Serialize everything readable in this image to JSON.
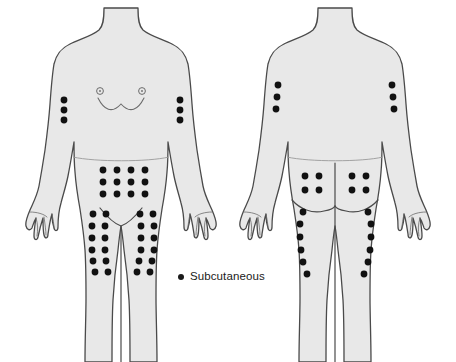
{
  "diagram": {
    "type": "medical-body-map",
    "colors": {
      "body_fill": "#e8e8e8",
      "body_outline": "#4a4a4a",
      "detail_line": "#6b6b6b",
      "dot": "#111111",
      "background": "#ffffff"
    },
    "views": [
      {
        "name": "anterior",
        "label": "Front view",
        "regions": [
          {
            "name": "left-upper-arm",
            "label": "Left upper arm",
            "pattern": "vertical-line",
            "count": 3,
            "dots": [
              [
                64,
                100
              ],
              [
                64,
                110
              ],
              [
                64,
                120
              ]
            ]
          },
          {
            "name": "right-upper-arm",
            "label": "Right upper arm",
            "pattern": "vertical-line",
            "count": 3,
            "dots": [
              [
                180,
                100
              ],
              [
                180,
                110
              ],
              [
                180,
                120
              ]
            ]
          },
          {
            "name": "abdomen",
            "label": "Abdomen",
            "pattern": "grid-4x3",
            "count": 12,
            "dots": [
              [
                103,
                170
              ],
              [
                117,
                170
              ],
              [
                131,
                170
              ],
              [
                145,
                170
              ],
              [
                103,
                182
              ],
              [
                117,
                182
              ],
              [
                131,
                182
              ],
              [
                145,
                182
              ],
              [
                103,
                194
              ],
              [
                117,
                194
              ],
              [
                131,
                194
              ],
              [
                145,
                194
              ]
            ]
          },
          {
            "name": "left-thigh",
            "label": "Left anterior thigh",
            "pattern": "two-column",
            "count": 12,
            "dots": [
              [
                93,
                214
              ],
              [
                106,
                214
              ],
              [
                92,
                226
              ],
              [
                105,
                226
              ],
              [
                92,
                238
              ],
              [
                105,
                238
              ],
              [
                92,
                250
              ],
              [
                105,
                250
              ],
              [
                93,
                261
              ],
              [
                106,
                261
              ],
              [
                95,
                272
              ],
              [
                108,
                272
              ]
            ]
          },
          {
            "name": "right-thigh",
            "label": "Right anterior thigh",
            "pattern": "two-column",
            "count": 12,
            "dots": [
              [
                140,
                214
              ],
              [
                153,
                214
              ],
              [
                141,
                226
              ],
              [
                154,
                226
              ],
              [
                141,
                238
              ],
              [
                154,
                238
              ],
              [
                141,
                250
              ],
              [
                154,
                250
              ],
              [
                139,
                261
              ],
              [
                152,
                261
              ],
              [
                137,
                272
              ],
              [
                150,
                272
              ]
            ]
          }
        ]
      },
      {
        "name": "posterior",
        "label": "Back view",
        "regions": [
          {
            "name": "left-upper-arm-back",
            "label": "Left upper arm",
            "pattern": "vertical-line",
            "count": 3,
            "dots": [
              [
                278,
                85
              ],
              [
                277,
                97
              ],
              [
                276,
                109
              ]
            ]
          },
          {
            "name": "right-upper-arm-back",
            "label": "Right upper arm",
            "pattern": "vertical-line",
            "count": 3,
            "dots": [
              [
                392,
                85
              ],
              [
                393,
                97
              ],
              [
                394,
                109
              ]
            ]
          },
          {
            "name": "left-buttock",
            "label": "Left buttock",
            "pattern": "grid-2x2",
            "count": 4,
            "dots": [
              [
                305,
                176
              ],
              [
                319,
                176
              ],
              [
                305,
                190
              ],
              [
                319,
                190
              ]
            ]
          },
          {
            "name": "right-buttock",
            "label": "Right buttock",
            "pattern": "grid-2x2",
            "count": 4,
            "dots": [
              [
                352,
                176
              ],
              [
                366,
                176
              ],
              [
                352,
                190
              ],
              [
                366,
                190
              ]
            ]
          },
          {
            "name": "left-posterior-thigh",
            "label": "Left posterior thigh",
            "pattern": "curved-line",
            "count": 6,
            "dots": [
              [
                303,
                212
              ],
              [
                300,
                224
              ],
              [
                300,
                237
              ],
              [
                301,
                250
              ],
              [
                303,
                262
              ],
              [
                307,
                274
              ]
            ]
          },
          {
            "name": "right-posterior-thigh",
            "label": "Right posterior thigh",
            "pattern": "curved-line",
            "count": 6,
            "dots": [
              [
                368,
                212
              ],
              [
                371,
                224
              ],
              [
                371,
                237
              ],
              [
                370,
                250
              ],
              [
                368,
                262
              ],
              [
                364,
                274
              ]
            ]
          }
        ]
      }
    ]
  },
  "legend": {
    "marker": "filled-dot",
    "label": "Subcutaneous"
  }
}
